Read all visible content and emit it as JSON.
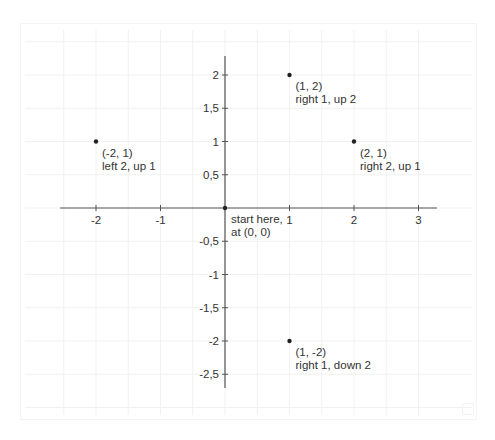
{
  "chart_data": {
    "type": "scatter",
    "title": "",
    "xlabel": "",
    "ylabel": "",
    "xlim": [
      -2.5,
      3.3
    ],
    "ylim": [
      -2.7,
      2.3
    ],
    "grid": true,
    "x_ticks": [
      -2,
      -1,
      1,
      2,
      3
    ],
    "x_tick_labels": [
      "-2",
      "-1",
      "1",
      "2",
      "3"
    ],
    "y_ticks": [
      2,
      1.5,
      1,
      0.5,
      -0.5,
      -1,
      -1.5,
      -2,
      -2.5
    ],
    "y_tick_labels": [
      "2",
      "1,5",
      "1",
      "0,5",
      "-0,5",
      "-1",
      "-1,5",
      "-2",
      "-2,5"
    ],
    "points": [
      {
        "x": 0,
        "y": 0,
        "label_line1": "start here,",
        "label_line2": "at (0, 0)"
      },
      {
        "x": 1,
        "y": 2,
        "label_line1": "(1, 2)",
        "label_line2": "right 1, up 2"
      },
      {
        "x": 2,
        "y": 1,
        "label_line1": "(2, 1)",
        "label_line2": "right 2, up 1"
      },
      {
        "x": -2,
        "y": 1,
        "label_line1": "(-2, 1)",
        "label_line2": "left 2, up 1"
      },
      {
        "x": 1,
        "y": -2,
        "label_line1": "(1, -2)",
        "label_line2": "right 1, down 2"
      }
    ],
    "colors": {
      "axis": "#555555",
      "grid": "#f1f1f1",
      "point": "#222222",
      "text": "#333333"
    }
  }
}
